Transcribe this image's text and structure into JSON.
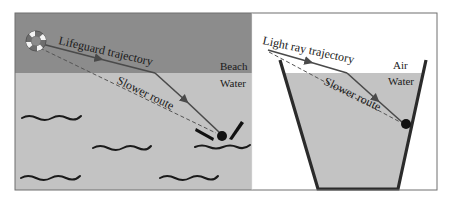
{
  "figure": {
    "left_panel": {
      "path_label": "Lifeguard trajectory",
      "alt_label": "Slower route",
      "top_region_label": "Beach",
      "bottom_region_label": "Water",
      "icons": [
        "life-ring-icon",
        "swimmer-icon",
        "wave-icon"
      ]
    },
    "right_panel": {
      "path_label": "Light ray trajectory",
      "alt_label": "Slower route",
      "top_region_label": "Air",
      "bottom_region_label": "Water",
      "icons": [
        "container-icon",
        "target-point-icon"
      ]
    },
    "colors": {
      "beach": "#8c8c8c",
      "water": "#c3c3c3",
      "air": "#ffffff",
      "lines": "#4a4a4a",
      "frame": "#6f6f6f",
      "container": "#2b2b2b"
    }
  }
}
